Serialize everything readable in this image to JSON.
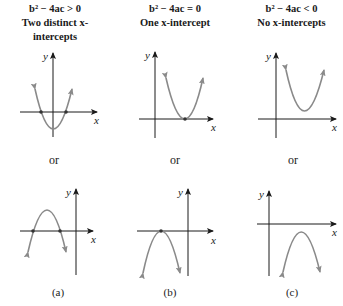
{
  "headers": [
    {
      "condition": "b² − 4ac > 0",
      "description": "Two distinct x-intercepts"
    },
    {
      "condition": "b² − 4ac = 0",
      "description": "One x-intercept"
    },
    {
      "condition": "b² − 4ac < 0",
      "description": "No x-intercepts"
    }
  ],
  "separator": [
    "or",
    "or",
    "or"
  ],
  "panel_labels": [
    "(a)",
    "(b)",
    "(c)"
  ],
  "axes": {
    "x_label": "x",
    "y_label": "y"
  },
  "colors": {
    "curve": "#8a8a8a",
    "axis": "#1a1a1a",
    "point": "#333333"
  },
  "graphs": {
    "top": [
      {
        "column": "a",
        "opens": "up",
        "x_intercepts": 2
      },
      {
        "column": "b",
        "opens": "up",
        "x_intercepts": 1
      },
      {
        "column": "c",
        "opens": "up",
        "x_intercepts": 0
      }
    ],
    "bottom": [
      {
        "column": "a",
        "opens": "down",
        "x_intercepts": 2
      },
      {
        "column": "b",
        "opens": "down",
        "x_intercepts": 1
      },
      {
        "column": "c",
        "opens": "down",
        "x_intercepts": 0
      }
    ]
  }
}
